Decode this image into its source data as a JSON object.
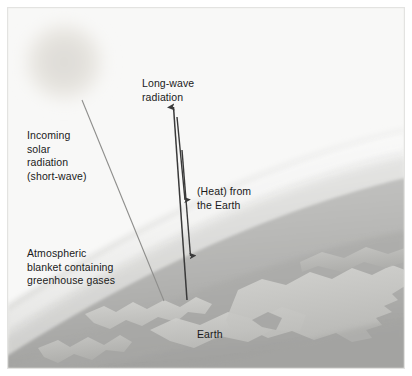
{
  "figure": {
    "width": 412,
    "height": 376
  },
  "labels": {
    "incoming_solar": "Incoming\nsolar\nradiation\n(short-wave)",
    "long_wave": "Long-wave\nradiation",
    "heat_from_earth": "(Heat) from\nthe Earth",
    "atmospheric_blanket": "Atmospheric\nblanket containing\ngreenhouse gases",
    "earth": "Earth"
  },
  "colors": {
    "background": "#f8f8f7",
    "border": "#e6e6e4",
    "sun": "#e3e1dc",
    "atmosphere_outer": "#f2f2f1",
    "atmosphere_inner": "#d8d8d6",
    "earth_body": "#b9b9b7",
    "earth_land": "#cfcfcc",
    "earth_shadow": "#9e9e9c",
    "arrow": "#3a3a3a",
    "ray": "#8c8c8a",
    "text": "#1a1a1a"
  },
  "elements": {
    "sun": {
      "cx": 64,
      "cy": 62,
      "r": 45
    },
    "solar_ray": {
      "x1": 82,
      "y1": 100,
      "x2": 164,
      "y2": 301
    },
    "longwave_arrow": {
      "x1": 186,
      "y1": 298,
      "x2": 174,
      "y2": 107
    },
    "heat_arrow_1": {
      "x1": 178,
      "y1": 118,
      "x2": 185,
      "y2": 202
    },
    "heat_arrow_2": {
      "x1": 182,
      "y1": 150,
      "x2": 190,
      "y2": 258
    }
  }
}
